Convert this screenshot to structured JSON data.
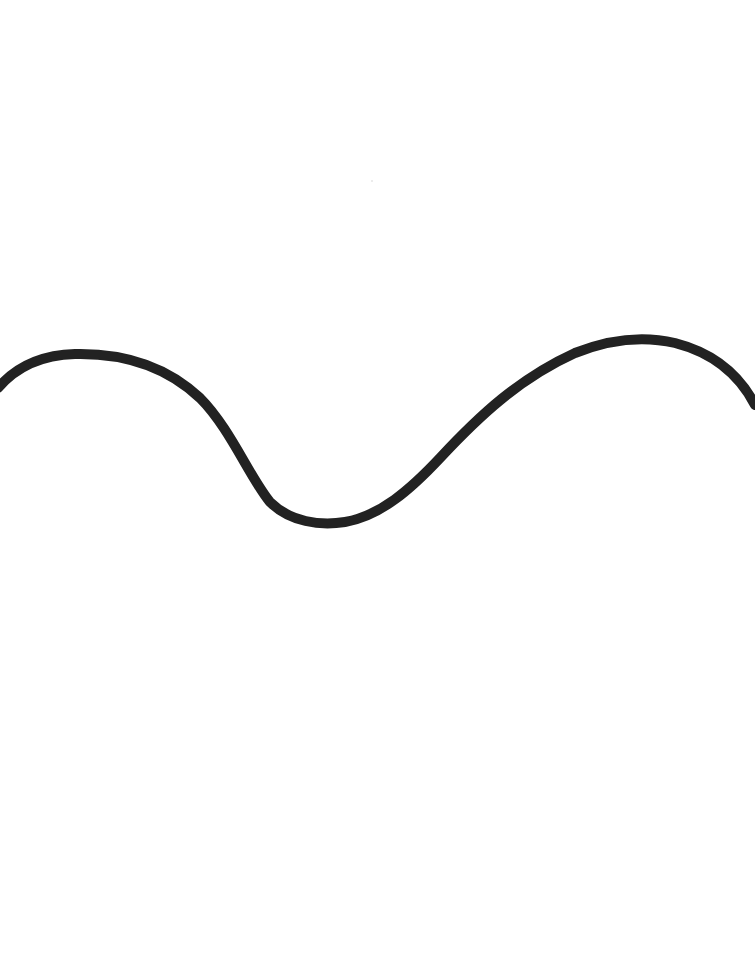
{
  "image": {
    "description": "Hand-drawn thick black wavy line on a white background",
    "background_color": "#ffffff",
    "stroke_color": "#222222",
    "shape": "wave",
    "features": [
      "left-crest",
      "trough",
      "right-crest"
    ]
  }
}
